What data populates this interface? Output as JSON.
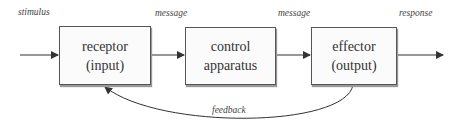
{
  "diagram": {
    "boxes": [
      {
        "id": "receptor",
        "line1": "receptor",
        "line2": "(input)"
      },
      {
        "id": "control",
        "line1": "control",
        "line2": "apparatus"
      },
      {
        "id": "effector",
        "line1": "effector",
        "line2": "(output)"
      }
    ],
    "labels": {
      "stimulus": "stimulus",
      "message1": "message",
      "message2": "message",
      "response": "response",
      "feedback": "feedback"
    },
    "colors": {
      "stroke": "#333333",
      "box_fill": "#fbfbfb"
    }
  }
}
